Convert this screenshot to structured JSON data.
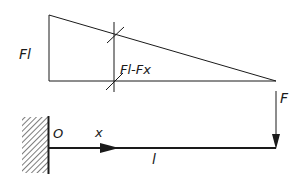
{
  "diagram": {
    "type": "bending-moment-diagram-cantilever",
    "colors": {
      "ink": "#1a1a1a",
      "background": "#ffffff",
      "hatch": "#444444"
    },
    "moment_diagram": {
      "max_label": "Fl",
      "section_label": "Fl-Fx"
    },
    "beam": {
      "origin_label": "O",
      "position_label": "x",
      "length_label": "l",
      "force_label": "F"
    }
  }
}
